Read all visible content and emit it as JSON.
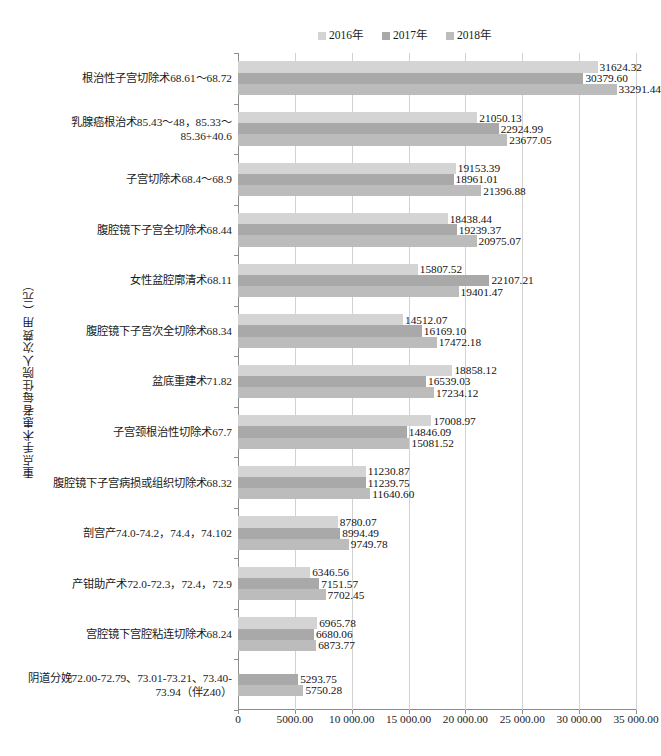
{
  "chart_data": {
    "type": "bar",
    "orientation": "horizontal",
    "title": "",
    "xlabel": "",
    "ylabel": "重点手术患者每住院人次费用（元）",
    "xlim": [
      0,
      35000
    ],
    "xticks": [
      0,
      5000,
      10000,
      15000,
      20000,
      25000,
      30000,
      35000
    ],
    "xticklabels": [
      "0",
      "5000.00",
      "10 000.00",
      "15 000.00",
      "20 000.00",
      "25 000.00",
      "30 000.00",
      "35 000.00"
    ],
    "grid": true,
    "legend_position": "top-center",
    "categories": [
      "根治性子宫切除术68.61～68.72",
      "乳腺癌根治术85.43～48，85.33～85.36+40.6",
      "子宫切除术68.4～68.9",
      "腹腔镜下子宫全切除术68.44",
      "女性盆腔廓清术68.11",
      "腹腔镜下子宫次全切除术68.34",
      "盆底重建术71.82",
      "子宫颈根治性切除术67.7",
      "腹腔镜下子宫病损或组织切除术68.32",
      "剖宫产74.0-74.2，74.4，74.102",
      "产钳助产术72.0-72.3，72.4，72.9",
      "宫腔镜下宫腔粘连切除术68.24",
      "阴道分娩72.00-72.79、73.01-73.21、73.40-73.94（伴Z40）"
    ],
    "series": [
      {
        "name": "2016年",
        "color": "#d4d4d4",
        "values": [
          31624.32,
          21050.13,
          19153.39,
          18438.44,
          15807.52,
          14512.07,
          18858.12,
          17008.97,
          11230.87,
          8780.07,
          6346.56,
          6965.78,
          null
        ],
        "labels": [
          "31624.32",
          "21050.13",
          "19153.39",
          "18438.44",
          "15807.52",
          "14512.07",
          "18858.12",
          "17008.97",
          "11230.87",
          "8780.07",
          "6346.56",
          "6965.78",
          ""
        ]
      },
      {
        "name": "2017年",
        "color": "#a9a9a9",
        "values": [
          30379.6,
          22924.99,
          18961.01,
          19239.37,
          22107.21,
          16169.1,
          16539.03,
          14846.09,
          11239.75,
          8994.49,
          7151.57,
          6680.06,
          5293.75
        ],
        "labels": [
          "30379.60",
          "22924.99",
          "18961.01",
          "19239.37",
          "22107.21",
          "16169.10",
          "16539.03",
          "14846.09",
          "11239.75",
          "8994.49",
          "7151.57",
          "6680.06",
          "5293.75"
        ]
      },
      {
        "name": "2018年",
        "color": "#bcbcbc",
        "values": [
          33291.44,
          23677.05,
          21396.88,
          20975.07,
          19401.47,
          17472.18,
          17234.12,
          15081.52,
          11640.6,
          9749.78,
          7702.45,
          6873.77,
          5750.28
        ],
        "labels": [
          "33291.44",
          "23677.05",
          "21396.88",
          "20975.07",
          "19401.47",
          "17472.18",
          "17234.12",
          "15081.52",
          "11640.60",
          "9749.78",
          "7702.45",
          "6873.77",
          "5750.28"
        ]
      }
    ]
  }
}
